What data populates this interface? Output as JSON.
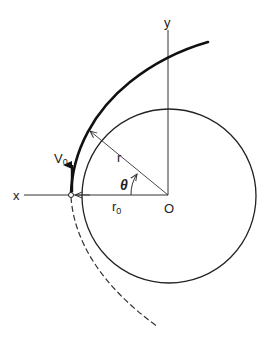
{
  "diagram": {
    "labels": {
      "x_axis": "x",
      "y_axis": "y",
      "origin": "O",
      "radius": "r",
      "initial_radius": "r",
      "initial_radius_sub": "0",
      "angle": "θ",
      "velocity": "V",
      "velocity_sub": "0"
    },
    "colors": {
      "line": "#222222",
      "background": "#ffffff"
    }
  }
}
